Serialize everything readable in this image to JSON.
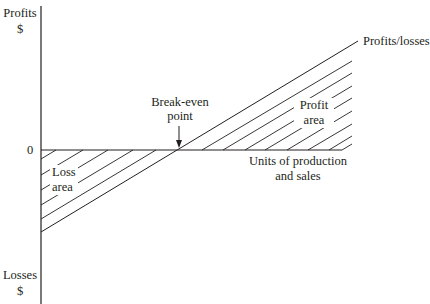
{
  "diagram": {
    "y_axis": {
      "top_label": "Profits",
      "top_unit": "$",
      "bottom_label": "Losses",
      "bottom_unit": "$",
      "zero_label": "0"
    },
    "x_axis": {
      "label_line1": "Units of production",
      "label_line2": "and sales"
    },
    "line_label": "Profits/losses",
    "break_even": {
      "line1": "Break-even",
      "line2": "point"
    },
    "regions": {
      "loss": {
        "line1": "Loss",
        "line2": "area"
      },
      "profit": {
        "line1": "Profit",
        "line2": "area"
      }
    },
    "colors": {
      "ink": "#231f20",
      "background": "#ffffff"
    }
  }
}
